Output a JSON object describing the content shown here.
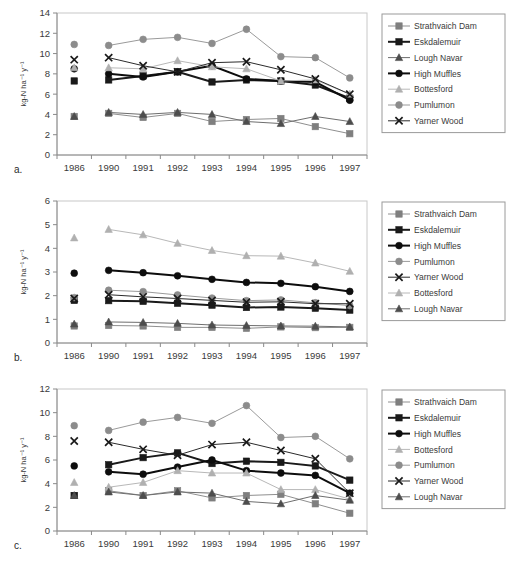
{
  "figure": {
    "panels": [
      {
        "letter": "a.",
        "ylabel": "kg-N ha⁻¹ y⁻¹",
        "ymin": 0,
        "ymax": 14,
        "ystep": 2,
        "legend_order": [
          "Strathvaich Dam",
          "Eskdalemuir",
          "Lough Navar",
          "High Muffles",
          "Bottesford",
          "Pumlumon",
          "Yarner Wood"
        ]
      },
      {
        "letter": "b.",
        "ylabel": "kg-N ha⁻¹ y⁻¹",
        "ymin": 0,
        "ymax": 6,
        "ystep": 1,
        "legend_order": [
          "Strathvaich Dam",
          "Eskdalemuir",
          "High Muffles",
          "Pumlumon",
          "Yarner Wood",
          "Bottesford",
          "Lough Navar"
        ]
      },
      {
        "letter": "c.",
        "ylabel": "kg-N ha⁻¹ y⁻¹",
        "ymin": 0,
        "ymax": 12,
        "ystep": 2,
        "legend_order": [
          "Strathvaich Dam",
          "Eskdalemuir",
          "High Muffles",
          "Bottesford",
          "Pumlumon",
          "Yarner Wood",
          "Lough Navar"
        ]
      }
    ],
    "series_style": {
      "Strathvaich Dam": {
        "marker": "square",
        "color": "#7f7f7f",
        "line_color": "#8f8f8f",
        "line_width": 1
      },
      "Eskdalemuir": {
        "marker": "square",
        "color": "#1a1a1a",
        "line_color": "#1a1a1a",
        "line_width": 2
      },
      "Lough Navar": {
        "marker": "triangle",
        "color": "#4d4d4d",
        "line_color": "#6e6e6e",
        "line_width": 1
      },
      "High Muffles": {
        "marker": "circle",
        "color": "#0d0d0d",
        "line_color": "#0d0d0d",
        "line_width": 2
      },
      "Bottesford": {
        "marker": "triangle",
        "color": "#b0b0b0",
        "line_color": "#b8b8b8",
        "line_width": 1
      },
      "Pumlumon": {
        "marker": "circle",
        "color": "#8c8c8c",
        "line_color": "#9a9a9a",
        "line_width": 1
      },
      "Yarner Wood": {
        "marker": "cross",
        "color": "#1a1a1a",
        "line_color": "#2b2b2b",
        "line_width": 1
      }
    }
  },
  "chart_data": [
    {
      "type": "line",
      "panel": "a.",
      "title": "",
      "xlabel": "",
      "ylabel": "kg-N ha-1 y-1",
      "categories": [
        "1986",
        "1990",
        "1991",
        "1992",
        "1993",
        "1994",
        "1995",
        "1996",
        "1997"
      ],
      "ylim": [
        0,
        14
      ],
      "yticks": [
        0,
        2,
        4,
        6,
        8,
        10,
        12,
        14
      ],
      "grid": false,
      "legend_position": "right",
      "gap_after_first_category": true,
      "series": [
        {
          "name": "Strathvaich Dam",
          "values": [
            3.8,
            4.1,
            3.7,
            4.1,
            3.3,
            3.5,
            3.6,
            2.8,
            2.1
          ]
        },
        {
          "name": "Eskdalemuir",
          "values": [
            7.3,
            7.4,
            7.8,
            8.2,
            7.2,
            7.4,
            7.3,
            6.9,
            5.6
          ]
        },
        {
          "name": "Lough Navar",
          "values": [
            3.8,
            4.2,
            4.0,
            4.2,
            4.0,
            3.3,
            3.1,
            3.8,
            3.3
          ]
        },
        {
          "name": "High Muffles",
          "values": [
            8.5,
            8.0,
            7.7,
            8.2,
            8.8,
            7.5,
            7.3,
            7.2,
            5.4
          ]
        },
        {
          "name": "Bottesford",
          "values": [
            8.6,
            8.6,
            8.5,
            9.3,
            8.7,
            8.5,
            7.3,
            7.4,
            6.0
          ]
        },
        {
          "name": "Pumlumon",
          "values": [
            10.9,
            10.8,
            11.4,
            11.6,
            11.0,
            12.4,
            9.7,
            9.6,
            7.6
          ]
        },
        {
          "name": "Yarner Wood",
          "values": [
            9.4,
            9.6,
            8.8,
            8.2,
            9.1,
            9.2,
            8.4,
            7.5,
            6.0
          ]
        }
      ]
    },
    {
      "type": "line",
      "panel": "b.",
      "title": "",
      "xlabel": "",
      "ylabel": "kg-N ha-1 y-1",
      "categories": [
        "1986",
        "1990",
        "1991",
        "1992",
        "1993",
        "1994",
        "1995",
        "1996",
        "1997"
      ],
      "ylim": [
        0,
        6
      ],
      "yticks": [
        0,
        1,
        2,
        3,
        4,
        5,
        6
      ],
      "grid": false,
      "legend_position": "right",
      "gap_after_first_category": true,
      "series": [
        {
          "name": "Strathvaich Dam",
          "values": [
            0.72,
            0.74,
            0.72,
            0.66,
            0.66,
            0.62,
            0.68,
            0.65,
            0.66
          ]
        },
        {
          "name": "Eskdalemuir",
          "values": [
            1.8,
            1.79,
            1.76,
            1.68,
            1.6,
            1.5,
            1.52,
            1.47,
            1.39
          ]
        },
        {
          "name": "High Muffles",
          "values": [
            2.95,
            3.07,
            2.97,
            2.84,
            2.69,
            2.56,
            2.52,
            2.38,
            2.18
          ]
        },
        {
          "name": "Pumlumon",
          "values": [
            1.92,
            2.23,
            2.17,
            2.03,
            1.9,
            1.79,
            1.82,
            1.7,
            1.58
          ]
        },
        {
          "name": "Yarner Wood",
          "values": [
            1.88,
            2.04,
            1.95,
            1.88,
            1.8,
            1.72,
            1.74,
            1.66,
            1.66
          ]
        },
        {
          "name": "Bottesford",
          "values": [
            4.44,
            4.8,
            4.57,
            4.21,
            3.91,
            3.69,
            3.67,
            3.38,
            3.03
          ]
        },
        {
          "name": "Lough Navar",
          "values": [
            0.8,
            0.89,
            0.87,
            0.83,
            0.76,
            0.74,
            0.72,
            0.71,
            0.68
          ]
        }
      ]
    },
    {
      "type": "line",
      "panel": "c.",
      "title": "",
      "xlabel": "",
      "ylabel": "kg-N ha-1 y-1",
      "categories": [
        "1986",
        "1990",
        "1991",
        "1992",
        "1993",
        "1994",
        "1995",
        "1996",
        "1997"
      ],
      "ylim": [
        0,
        12
      ],
      "yticks": [
        0,
        2,
        4,
        6,
        8,
        10,
        12
      ],
      "grid": false,
      "legend_position": "right",
      "gap_after_first_category": true,
      "series": [
        {
          "name": "Strathvaich Dam",
          "values": [
            3.0,
            3.4,
            3.0,
            3.4,
            2.8,
            3.0,
            3.1,
            2.3,
            1.5
          ]
        },
        {
          "name": "Eskdalemuir",
          "values": [
            3.0,
            5.6,
            6.2,
            6.6,
            5.7,
            5.9,
            5.8,
            5.5,
            4.3
          ]
        },
        {
          "name": "High Muffles",
          "values": [
            5.5,
            5.0,
            4.8,
            5.4,
            6.0,
            5.1,
            4.9,
            4.7,
            3.2
          ]
        },
        {
          "name": "Bottesford",
          "values": [
            4.1,
            3.7,
            4.1,
            5.1,
            4.9,
            4.9,
            3.5,
            3.5,
            2.7
          ]
        },
        {
          "name": "Pumlumon",
          "values": [
            8.9,
            8.5,
            9.2,
            9.6,
            9.1,
            10.6,
            7.9,
            8.0,
            6.1
          ]
        },
        {
          "name": "Yarner Wood",
          "values": [
            7.6,
            7.5,
            6.9,
            6.4,
            7.3,
            7.5,
            6.8,
            6.1,
            3.2
          ]
        },
        {
          "name": "Lough Navar",
          "values": [
            3.0,
            3.3,
            3.0,
            3.3,
            3.2,
            2.5,
            2.3,
            3.0,
            2.6
          ]
        }
      ]
    }
  ]
}
